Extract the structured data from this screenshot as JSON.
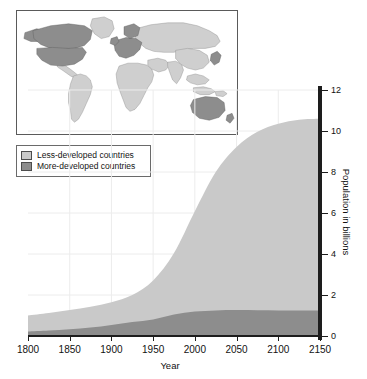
{
  "figure": {
    "kind": "stacked-area-chart-with-map-inset"
  },
  "legend": {
    "items": [
      {
        "label": "Less-developed countries",
        "color": "#c9c9c9",
        "key": "less"
      },
      {
        "label": "More-developed countries",
        "color": "#8d8d8d",
        "key": "more"
      }
    ]
  },
  "map_inset": {
    "name": "world-map",
    "more_developed_color": "#8d8d8d",
    "less_developed_color": "#cfcfcf",
    "ocean_color": "#ffffff",
    "more_developed_regions": [
      "North America",
      "Europe",
      "Japan",
      "Australia",
      "New Zealand"
    ],
    "less_developed_regions": [
      "Latin America",
      "Africa",
      "Asia",
      "Russia",
      "Oceania"
    ]
  },
  "chart_data": {
    "type": "area",
    "title": "",
    "xlabel": "Year",
    "ylabel": "Population in billions",
    "xlim": [
      1800,
      2150
    ],
    "ylim": [
      0,
      12
    ],
    "xticks": [
      1800,
      1850,
      1900,
      1950,
      2000,
      2050,
      2100,
      2150
    ],
    "yticks": [
      0,
      2,
      4,
      6,
      8,
      10,
      12
    ],
    "grid": true,
    "legend_position": "top-left",
    "stacked": true,
    "x": [
      1800,
      1825,
      1850,
      1875,
      1900,
      1925,
      1950,
      1975,
      2000,
      2025,
      2050,
      2075,
      2100,
      2125,
      2150
    ],
    "series": [
      {
        "name": "More-developed countries",
        "color": "#8d8d8d",
        "values": [
          0.22,
          0.27,
          0.33,
          0.41,
          0.54,
          0.68,
          0.81,
          1.05,
          1.19,
          1.25,
          1.27,
          1.26,
          1.25,
          1.25,
          1.25
        ]
      },
      {
        "name": "Less-developed countries",
        "color": "#c9c9c9",
        "values": [
          0.78,
          0.85,
          0.94,
          1.02,
          1.11,
          1.32,
          1.9,
          3.0,
          4.9,
          6.75,
          7.95,
          8.7,
          9.1,
          9.3,
          9.35
        ]
      }
    ],
    "totals": [
      1.0,
      1.12,
      1.27,
      1.43,
      1.65,
      2.0,
      2.71,
      4.05,
      6.09,
      8.0,
      9.22,
      9.96,
      10.35,
      10.55,
      10.6
    ]
  }
}
